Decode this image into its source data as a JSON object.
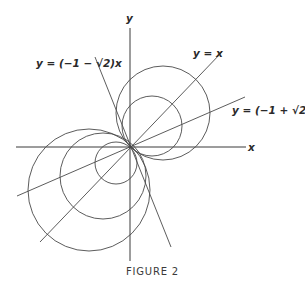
{
  "figure": {
    "caption": "FIGURE 2",
    "origin": [
      130,
      147
    ],
    "axes": {
      "x": {
        "label": "x",
        "from": [
          16,
          147
        ],
        "to": [
          246,
          147
        ]
      },
      "y": {
        "label": "y",
        "from": [
          130,
          28
        ],
        "to": [
          130,
          261
        ]
      }
    },
    "lines": [
      {
        "id": "y-eq-x",
        "equation": "y = x",
        "label": "y = x",
        "from": [
          40,
          242
        ],
        "to": [
          222,
          52
        ]
      },
      {
        "id": "y-eq-neg1-plus-sqrt2-x",
        "equation": "y = (-1 + √2)x",
        "label": "y = (−1 + √2)x",
        "from": [
          17,
          196
        ],
        "to": [
          245,
          97
        ]
      },
      {
        "id": "y-eq-neg1-minus-sqrt2-x",
        "equation": "y = (-1 - √2)x",
        "label": "y = (−1 − √2)x",
        "from": [
          95,
          57
        ],
        "to": [
          171,
          247
        ]
      }
    ],
    "circles": [
      {
        "id": "upper-large",
        "cx": 163,
        "cy": 113,
        "r": 47
      },
      {
        "id": "upper-small",
        "cx": 152,
        "cy": 126,
        "r": 30
      },
      {
        "id": "lower-small",
        "cx": 116,
        "cy": 163,
        "r": 21
      },
      {
        "id": "lower-medium",
        "cx": 103,
        "cy": 176,
        "r": 43
      },
      {
        "id": "lower-large",
        "cx": 89,
        "cy": 190,
        "r": 61
      }
    ],
    "labels": {
      "x_axis": "x",
      "y_axis": "y",
      "line_y_eq_x": "y = x",
      "line_pos": "y = (−1 + √2)x",
      "line_neg": "y = (−1 − √2)x"
    },
    "stroke_color": "#4a4a4a",
    "background": "#ffffff"
  }
}
